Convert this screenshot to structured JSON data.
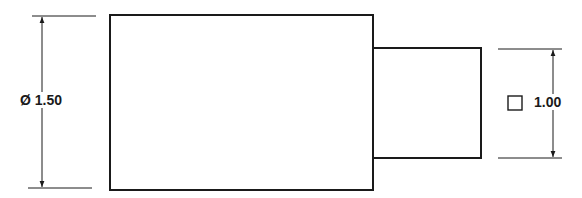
{
  "diagram": {
    "type": "engineering-drawing",
    "colors": {
      "line": "#1a1a1a",
      "background": "#ffffff"
    },
    "parts": [
      {
        "name": "large-section",
        "shape": "rectangle"
      },
      {
        "name": "small-section",
        "shape": "rectangle"
      }
    ],
    "dimensions": [
      {
        "name": "diameter-dimension",
        "symbol": "Ø",
        "value": "1.50",
        "label": "Ø 1.50",
        "applies_to": "large-section"
      },
      {
        "name": "square-dimension",
        "symbol": "square-icon",
        "value": "1.00",
        "label": "1.00",
        "applies_to": "small-section"
      }
    ]
  }
}
